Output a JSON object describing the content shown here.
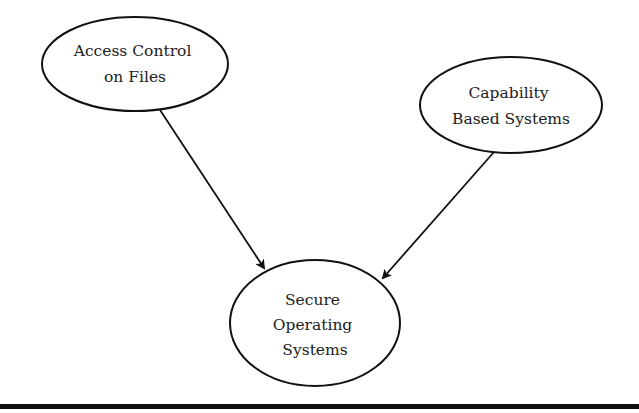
{
  "diagram": {
    "type": "directed-graph",
    "nodes": [
      {
        "id": "access_control",
        "lines": [
          "Access Control",
          "on Files"
        ],
        "cx": 135,
        "cy": 64,
        "rx": 93,
        "ry": 47
      },
      {
        "id": "capability",
        "lines": [
          "Capability",
          "Based Systems"
        ],
        "cx": 511,
        "cy": 105,
        "rx": 91,
        "ry": 48
      },
      {
        "id": "secure_os",
        "lines": [
          "Secure",
          "Operating",
          "Systems"
        ],
        "cx": 315,
        "cy": 323,
        "rx": 85,
        "ry": 63
      }
    ],
    "edges": [
      {
        "from": "access_control",
        "to": "secure_os"
      },
      {
        "from": "capability",
        "to": "secure_os"
      }
    ],
    "colors": {
      "stroke": "#111111",
      "text": "#222222",
      "background": "#ffffff"
    }
  }
}
